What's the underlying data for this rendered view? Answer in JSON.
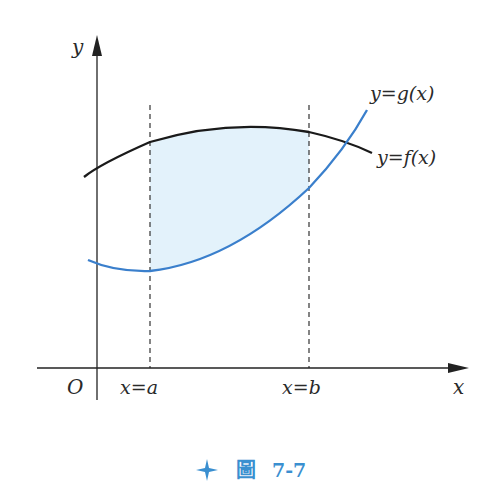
{
  "figure": {
    "caption_prefix": "圖",
    "caption_number": "7-7",
    "colors": {
      "axis": "#222222",
      "f_curve": "#1a1a1a",
      "g_curve": "#3a7fcc",
      "shade": "#e3f2fb",
      "caption": "#3a8fd0"
    }
  },
  "axes": {
    "x_label": "x",
    "y_label": "y",
    "origin_label": "O"
  },
  "bounds": {
    "left_label": "x=a",
    "right_label": "x=b"
  },
  "curves": {
    "g_label": "y=g(x)",
    "f_label": "y=f(x)"
  }
}
